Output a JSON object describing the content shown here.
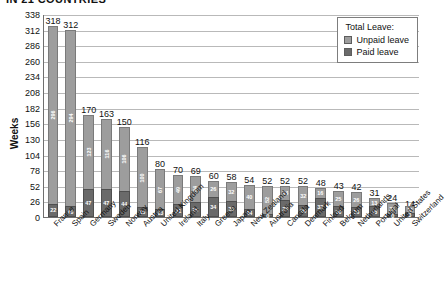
{
  "title": "IN 21 COUNTRIES",
  "legend": {
    "title": "Total Leave:",
    "items": [
      {
        "label": "Unpaid leave",
        "color": "#9d9d9d"
      },
      {
        "label": "Paid leave",
        "color": "#6a6a6a"
      }
    ]
  },
  "chart_data": {
    "type": "bar",
    "subtype": "stacked-bar",
    "title": "IN 21 COUNTRIES",
    "xlabel": "",
    "ylabel": "Weeks",
    "ylim": [
      0,
      338
    ],
    "yticks": [
      0,
      26,
      52,
      78,
      104,
      130,
      156,
      182,
      208,
      234,
      260,
      286,
      312,
      338
    ],
    "grid": true,
    "legend_position": "top-right",
    "categories": [
      "France",
      "Spain",
      "Germany",
      "Sweden",
      "Norway",
      "Austria",
      "United Kingdom",
      "Ireland",
      "Italy",
      "Greece",
      "Japan",
      "New Zealand",
      "Australia",
      "Canada",
      "Denmark",
      "Finland",
      "Belgium",
      "Netherlands",
      "Portugal",
      "United States",
      "Switzerland"
    ],
    "totals": [
      318,
      312,
      170,
      163,
      150,
      116,
      80,
      70,
      69,
      60,
      58,
      54,
      52,
      52,
      52,
      48,
      43,
      42,
      31,
      24,
      14
    ],
    "series": [
      {
        "name": "Paid leave",
        "color": "#6a6a6a",
        "values": [
          22,
          18,
          47,
          47,
          44,
          16,
          13,
          21,
          25,
          34,
          26,
          14,
          0,
          28,
          20,
          32,
          18,
          16,
          18,
          0,
          3
        ]
      },
      {
        "name": "Unpaid leave",
        "color": "#9d9d9d",
        "values": [
          296,
          294,
          123,
          116,
          106,
          100,
          67,
          49,
          44,
          26,
          32,
          40,
          52,
          24,
          32,
          16,
          25,
          26,
          13,
          24,
          11
        ]
      }
    ]
  }
}
